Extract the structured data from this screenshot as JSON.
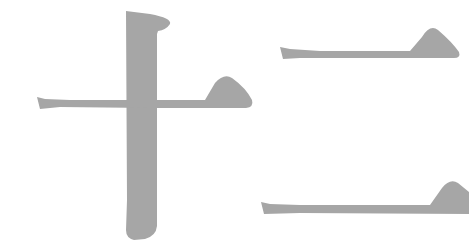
{
  "artwork": {
    "text": "十二",
    "characters": [
      {
        "char": "十",
        "meaning": "ten"
      },
      {
        "char": "二",
        "meaning": "two"
      }
    ],
    "stroke_color": "#a6a6a6",
    "background_color": "#ffffff"
  }
}
